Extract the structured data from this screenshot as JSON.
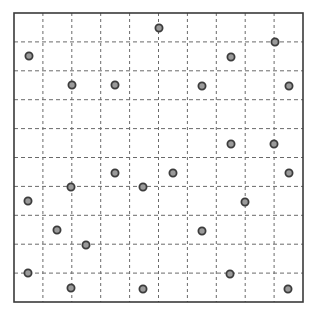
{
  "diagram": {
    "type": "dot-grid",
    "frame": {
      "x": 14,
      "y": 13,
      "width": 289,
      "height": 289
    },
    "grid": {
      "columns": 10,
      "rows": 10,
      "cell_size": 29,
      "line_style": "dashed"
    },
    "colors": {
      "background": "#ffffff",
      "frame": "#3a3a3a",
      "grid_line": "#6a6a6a",
      "dot_fill": "#9a9a9a",
      "dot_stroke": "#3c3c3c"
    },
    "dots": [
      {
        "x": 159,
        "y": 28
      },
      {
        "x": 275,
        "y": 42
      },
      {
        "x": 29,
        "y": 56
      },
      {
        "x": 231,
        "y": 57
      },
      {
        "x": 72,
        "y": 85
      },
      {
        "x": 115,
        "y": 85
      },
      {
        "x": 202,
        "y": 86
      },
      {
        "x": 289,
        "y": 86
      },
      {
        "x": 231,
        "y": 144
      },
      {
        "x": 274,
        "y": 144
      },
      {
        "x": 115,
        "y": 173
      },
      {
        "x": 173,
        "y": 173
      },
      {
        "x": 289,
        "y": 173
      },
      {
        "x": 71,
        "y": 187
      },
      {
        "x": 143,
        "y": 187
      },
      {
        "x": 28,
        "y": 201
      },
      {
        "x": 245,
        "y": 202
      },
      {
        "x": 57,
        "y": 230
      },
      {
        "x": 202,
        "y": 231
      },
      {
        "x": 86,
        "y": 245
      },
      {
        "x": 28,
        "y": 273
      },
      {
        "x": 230,
        "y": 274
      },
      {
        "x": 71,
        "y": 288
      },
      {
        "x": 143,
        "y": 289
      },
      {
        "x": 288,
        "y": 289
      }
    ]
  }
}
